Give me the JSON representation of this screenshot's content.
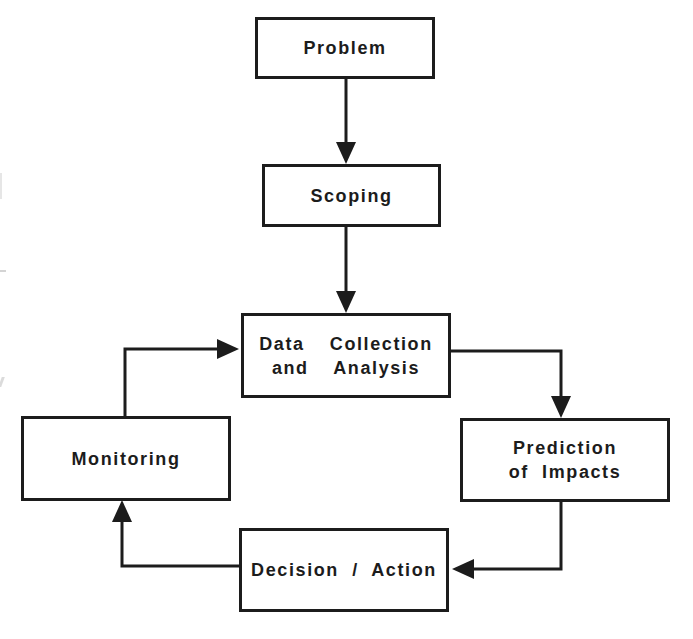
{
  "diagram": {
    "type": "flowchart",
    "colors": {
      "stroke": "#1c1c1c",
      "background": "#ffffff",
      "text": "#1c1c1c"
    },
    "nodes": [
      {
        "id": "problem",
        "lines": [
          "Problem"
        ]
      },
      {
        "id": "scoping",
        "lines": [
          "Scoping"
        ]
      },
      {
        "id": "data_collection",
        "lines": [
          "Data  Collection",
          "and  Analysis"
        ]
      },
      {
        "id": "prediction",
        "lines": [
          "Prediction",
          "of  Impacts"
        ]
      },
      {
        "id": "decision",
        "lines": [
          "Decision  /  Action"
        ]
      },
      {
        "id": "monitoring",
        "lines": [
          "Monitoring"
        ]
      }
    ],
    "edges": [
      {
        "from": "problem",
        "to": "scoping"
      },
      {
        "from": "scoping",
        "to": "data_collection"
      },
      {
        "from": "data_collection",
        "to": "prediction"
      },
      {
        "from": "prediction",
        "to": "decision"
      },
      {
        "from": "decision",
        "to": "monitoring"
      },
      {
        "from": "monitoring",
        "to": "data_collection"
      }
    ]
  }
}
